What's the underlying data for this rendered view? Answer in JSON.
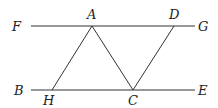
{
  "diagram": {
    "type": "geometry",
    "points": {
      "F": {
        "label": "F"
      },
      "G": {
        "label": "G"
      },
      "A": {
        "label": "A"
      },
      "D": {
        "label": "D"
      },
      "B": {
        "label": "B"
      },
      "E": {
        "label": "E"
      },
      "H": {
        "label": "H"
      },
      "C": {
        "label": "C"
      }
    },
    "segments": [
      {
        "name": "FG",
        "from": "F",
        "to": "G"
      },
      {
        "name": "BE",
        "from": "B",
        "to": "E"
      },
      {
        "name": "HA",
        "from": "H",
        "to": "A"
      },
      {
        "name": "AC",
        "from": "A",
        "to": "C"
      },
      {
        "name": "CD",
        "from": "C",
        "to": "D"
      }
    ],
    "relations": [
      "FG parallel BE"
    ]
  }
}
